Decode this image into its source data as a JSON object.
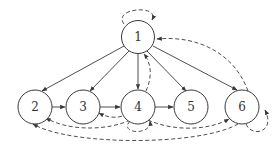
{
  "diagram": {
    "type": "directed-graph",
    "nodes": [
      {
        "id": "1",
        "label": "1"
      },
      {
        "id": "2",
        "label": "2"
      },
      {
        "id": "3",
        "label": "3"
      },
      {
        "id": "4",
        "label": "4"
      },
      {
        "id": "5",
        "label": "5"
      },
      {
        "id": "6",
        "label": "6"
      }
    ],
    "edges_solid": [
      {
        "from": "1",
        "to": "2"
      },
      {
        "from": "1",
        "to": "3"
      },
      {
        "from": "1",
        "to": "4"
      },
      {
        "from": "1",
        "to": "5"
      },
      {
        "from": "1",
        "to": "6"
      },
      {
        "from": "2",
        "to": "3"
      },
      {
        "from": "3",
        "to": "4"
      },
      {
        "from": "4",
        "to": "5"
      }
    ],
    "edges_dashed": [
      {
        "from": "1",
        "to": "1"
      },
      {
        "from": "4",
        "to": "1"
      },
      {
        "from": "6",
        "to": "1"
      },
      {
        "from": "4",
        "to": "3"
      },
      {
        "from": "4",
        "to": "2"
      },
      {
        "from": "4",
        "to": "4"
      },
      {
        "from": "4",
        "to": "6"
      },
      {
        "from": "6",
        "to": "2"
      },
      {
        "from": "6",
        "to": "6"
      }
    ],
    "colors": {
      "stroke": "#3a3a3a",
      "background": "#ffffff"
    }
  }
}
